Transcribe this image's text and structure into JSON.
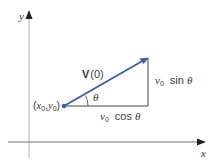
{
  "diagram": {
    "axes": {
      "x_label": "x",
      "y_label": "y"
    },
    "origin_point": {
      "label_open": "(",
      "x_var": "x",
      "x_sub": "0",
      "comma": ",",
      "y_var": "y",
      "y_sub": "0",
      "label_close": ")"
    },
    "vector": {
      "name": "V",
      "arg": "(0)"
    },
    "angle": {
      "symbol": "θ"
    },
    "vertical_component": {
      "var": "v",
      "sub": "0",
      "func": "sin",
      "angle": "θ"
    },
    "horizontal_component": {
      "var": "v",
      "sub": "0",
      "func": "cos",
      "angle": "θ"
    },
    "colors": {
      "vector": "#3f5fa8",
      "axes": "#2a2a2a",
      "lines": "#444444",
      "text": "#3a3a3a"
    }
  }
}
